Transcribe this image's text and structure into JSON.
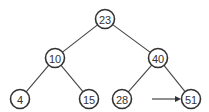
{
  "diagram": {
    "type": "binary-search-tree",
    "colors": {
      "background": "#ffffff",
      "stroke": "#333333",
      "edge": "#444444",
      "text": "#333333"
    },
    "nodes": [
      {
        "id": "n23",
        "label": "23",
        "x": 105,
        "y": 19,
        "r": 9.5
      },
      {
        "id": "n10",
        "label": "10",
        "x": 55,
        "y": 58,
        "r": 9.5
      },
      {
        "id": "n40",
        "label": "40",
        "x": 158,
        "y": 58,
        "r": 9.5
      },
      {
        "id": "n4",
        "label": "4",
        "x": 20,
        "y": 99,
        "r": 9.5
      },
      {
        "id": "n15",
        "label": "15",
        "x": 89,
        "y": 99,
        "r": 9.5
      },
      {
        "id": "n28",
        "label": "28",
        "x": 122,
        "y": 99,
        "r": 9.5
      },
      {
        "id": "n51",
        "label": "51",
        "x": 191,
        "y": 99,
        "r": 9.5
      }
    ],
    "edges": [
      {
        "from": "n23",
        "to": "n10"
      },
      {
        "from": "n23",
        "to": "n40"
      },
      {
        "from": "n10",
        "to": "n4"
      },
      {
        "from": "n10",
        "to": "n15"
      },
      {
        "from": "n40",
        "to": "n28"
      },
      {
        "from": "n40",
        "to": "n51"
      }
    ],
    "pointer": {
      "target": "n51",
      "x1": 152,
      "y1": 99,
      "x2": 181,
      "y2": 99
    }
  }
}
